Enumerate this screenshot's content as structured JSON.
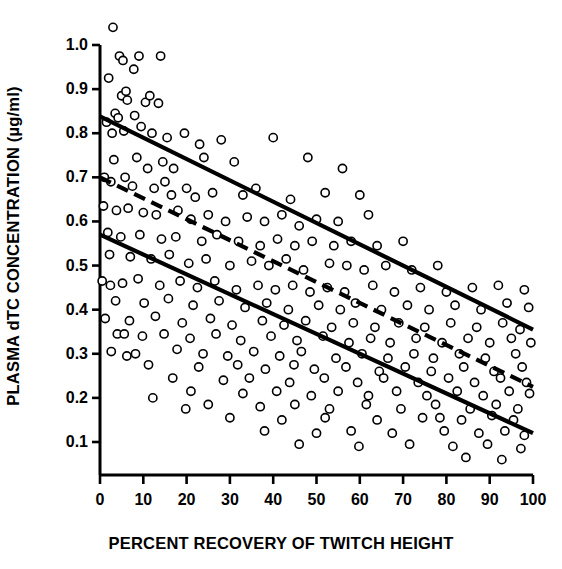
{
  "chart_data": {
    "type": "scatter",
    "title": "",
    "xlabel": "PERCENT RECOVERY OF TWITCH HEIGHT",
    "ylabel": "PLASMA dTC CONCENTRATION (µg/ml)",
    "xlim": [
      0,
      100
    ],
    "ylim": [
      0,
      1.06
    ],
    "grid": false,
    "legend": "none",
    "xticks": [
      0,
      10,
      20,
      30,
      40,
      50,
      60,
      70,
      80,
      90,
      100
    ],
    "xtick_labels": [
      "0",
      "10",
      "20",
      "30",
      "40",
      "50",
      "60",
      "70",
      "80",
      "90",
      "100"
    ],
    "yticks": [
      0.1,
      0.2,
      0.3,
      0.4,
      0.5,
      0.6,
      0.7,
      0.8,
      0.9,
      1.0
    ],
    "ytick_labels": [
      "0.1",
      "0.2",
      "0.3",
      "0.4",
      "0.5",
      "0.6",
      "0.7",
      "0.8",
      "0.9",
      "1.0"
    ],
    "marker": {
      "shape": "open-circle",
      "fill": "#ffffff",
      "stroke": "#000000",
      "radius_px": 4.1,
      "stroke_width_px": 1.6
    },
    "lines": [
      {
        "name": "upper-confidence-line",
        "style": "solid",
        "color": "#000000",
        "width_px": 4.2,
        "x": [
          0,
          100
        ],
        "y": [
          0.838,
          0.355
        ]
      },
      {
        "name": "regression-line",
        "style": "dashed",
        "color": "#000000",
        "width_px": 4.2,
        "dash_px": [
          12,
          7
        ],
        "x": [
          0,
          100
        ],
        "y": [
          0.7,
          0.225
        ]
      },
      {
        "name": "lower-confidence-line",
        "style": "solid",
        "color": "#000000",
        "width_px": 4.2,
        "x": [
          0,
          100
        ],
        "y": [
          0.57,
          0.12
        ]
      }
    ],
    "points": [
      [
        3.0,
        1.04
      ],
      [
        4.5,
        0.975
      ],
      [
        5.3,
        0.965
      ],
      [
        9.0,
        0.975
      ],
      [
        14.0,
        0.975
      ],
      [
        7.8,
        0.945
      ],
      [
        2.0,
        0.925
      ],
      [
        5.0,
        0.885
      ],
      [
        6.0,
        0.895
      ],
      [
        6.3,
        0.875
      ],
      [
        10.5,
        0.87
      ],
      [
        11.5,
        0.885
      ],
      [
        13.5,
        0.868
      ],
      [
        3.5,
        0.845
      ],
      [
        4.2,
        0.835
      ],
      [
        8.0,
        0.84
      ],
      [
        1.5,
        0.825
      ],
      [
        9.5,
        0.815
      ],
      [
        2.8,
        0.8
      ],
      [
        5.5,
        0.805
      ],
      [
        12.0,
        0.8
      ],
      [
        15.5,
        0.79
      ],
      [
        19.5,
        0.8
      ],
      [
        23.0,
        0.775
      ],
      [
        28.0,
        0.785
      ],
      [
        40.0,
        0.79
      ],
      [
        3.2,
        0.74
      ],
      [
        8.5,
        0.745
      ],
      [
        11.0,
        0.72
      ],
      [
        14.5,
        0.735
      ],
      [
        17.0,
        0.72
      ],
      [
        24.0,
        0.745
      ],
      [
        31.0,
        0.735
      ],
      [
        48.0,
        0.745
      ],
      [
        56.0,
        0.72
      ],
      [
        1.0,
        0.7
      ],
      [
        2.5,
        0.69
      ],
      [
        5.8,
        0.7
      ],
      [
        7.5,
        0.68
      ],
      [
        12.5,
        0.675
      ],
      [
        15.0,
        0.69
      ],
      [
        16.5,
        0.66
      ],
      [
        20.0,
        0.675
      ],
      [
        22.0,
        0.655
      ],
      [
        26.0,
        0.665
      ],
      [
        33.0,
        0.66
      ],
      [
        36.0,
        0.675
      ],
      [
        44.0,
        0.65
      ],
      [
        52.0,
        0.665
      ],
      [
        60.0,
        0.66
      ],
      [
        0.8,
        0.635
      ],
      [
        3.8,
        0.625
      ],
      [
        6.5,
        0.63
      ],
      [
        10.0,
        0.62
      ],
      [
        13.0,
        0.615
      ],
      [
        18.0,
        0.625
      ],
      [
        21.0,
        0.605
      ],
      [
        25.0,
        0.615
      ],
      [
        29.0,
        0.6
      ],
      [
        34.0,
        0.61
      ],
      [
        38.0,
        0.6
      ],
      [
        42.0,
        0.615
      ],
      [
        46.0,
        0.59
      ],
      [
        50.0,
        0.605
      ],
      [
        55.0,
        0.6
      ],
      [
        62.0,
        0.615
      ],
      [
        1.8,
        0.575
      ],
      [
        4.8,
        0.565
      ],
      [
        9.2,
        0.57
      ],
      [
        14.2,
        0.56
      ],
      [
        17.5,
        0.565
      ],
      [
        23.5,
        0.555
      ],
      [
        27.0,
        0.57
      ],
      [
        32.0,
        0.555
      ],
      [
        37.0,
        0.545
      ],
      [
        41.0,
        0.56
      ],
      [
        45.0,
        0.545
      ],
      [
        49.0,
        0.555
      ],
      [
        54.0,
        0.545
      ],
      [
        58.0,
        0.555
      ],
      [
        64.0,
        0.545
      ],
      [
        70.0,
        0.555
      ],
      [
        2.2,
        0.525
      ],
      [
        7.0,
        0.52
      ],
      [
        11.8,
        0.515
      ],
      [
        16.0,
        0.525
      ],
      [
        20.5,
        0.505
      ],
      [
        24.5,
        0.515
      ],
      [
        30.0,
        0.5
      ],
      [
        35.0,
        0.51
      ],
      [
        39.0,
        0.5
      ],
      [
        43.0,
        0.515
      ],
      [
        47.0,
        0.49
      ],
      [
        53.0,
        0.505
      ],
      [
        57.0,
        0.5
      ],
      [
        61.0,
        0.49
      ],
      [
        66.0,
        0.5
      ],
      [
        72.0,
        0.49
      ],
      [
        78.0,
        0.5
      ],
      [
        0.5,
        0.465
      ],
      [
        5.2,
        0.46
      ],
      [
        8.8,
        0.47
      ],
      [
        13.8,
        0.455
      ],
      [
        18.5,
        0.465
      ],
      [
        22.5,
        0.45
      ],
      [
        26.5,
        0.465
      ],
      [
        31.5,
        0.445
      ],
      [
        36.5,
        0.455
      ],
      [
        40.5,
        0.445
      ],
      [
        44.5,
        0.455
      ],
      [
        48.5,
        0.44
      ],
      [
        52.5,
        0.45
      ],
      [
        56.5,
        0.44
      ],
      [
        63.0,
        0.455
      ],
      [
        68.0,
        0.44
      ],
      [
        74.0,
        0.45
      ],
      [
        80.0,
        0.44
      ],
      [
        86.0,
        0.45
      ],
      [
        92.0,
        0.455
      ],
      [
        98.0,
        0.445
      ],
      [
        3.6,
        0.42
      ],
      [
        10.2,
        0.415
      ],
      [
        15.8,
        0.425
      ],
      [
        21.5,
        0.41
      ],
      [
        27.5,
        0.42
      ],
      [
        33.5,
        0.405
      ],
      [
        38.5,
        0.415
      ],
      [
        43.5,
        0.4
      ],
      [
        50.5,
        0.41
      ],
      [
        55.5,
        0.4
      ],
      [
        59.0,
        0.415
      ],
      [
        65.0,
        0.4
      ],
      [
        71.0,
        0.41
      ],
      [
        76.0,
        0.4
      ],
      [
        82.0,
        0.41
      ],
      [
        88.0,
        0.4
      ],
      [
        94.0,
        0.415
      ],
      [
        99.0,
        0.405
      ],
      [
        1.2,
        0.38
      ],
      [
        6.8,
        0.375
      ],
      [
        12.8,
        0.385
      ],
      [
        19.0,
        0.37
      ],
      [
        25.5,
        0.38
      ],
      [
        30.5,
        0.365
      ],
      [
        37.5,
        0.375
      ],
      [
        42.5,
        0.365
      ],
      [
        47.5,
        0.375
      ],
      [
        53.5,
        0.36
      ],
      [
        58.5,
        0.37
      ],
      [
        63.5,
        0.36
      ],
      [
        69.0,
        0.37
      ],
      [
        75.0,
        0.36
      ],
      [
        81.0,
        0.37
      ],
      [
        87.0,
        0.36
      ],
      [
        93.0,
        0.37
      ],
      [
        97.0,
        0.355
      ],
      [
        4.0,
        0.345
      ],
      [
        9.8,
        0.34
      ],
      [
        14.8,
        0.345
      ],
      [
        20.8,
        0.335
      ],
      [
        26.8,
        0.345
      ],
      [
        32.5,
        0.33
      ],
      [
        39.5,
        0.34
      ],
      [
        45.5,
        0.33
      ],
      [
        51.5,
        0.34
      ],
      [
        57.5,
        0.325
      ],
      [
        62.5,
        0.335
      ],
      [
        67.0,
        0.325
      ],
      [
        73.0,
        0.335
      ],
      [
        79.0,
        0.325
      ],
      [
        85.0,
        0.335
      ],
      [
        90.0,
        0.325
      ],
      [
        95.0,
        0.335
      ],
      [
        99.5,
        0.325
      ],
      [
        2.6,
        0.305
      ],
      [
        8.2,
        0.3
      ],
      [
        17.8,
        0.31
      ],
      [
        23.8,
        0.3
      ],
      [
        29.5,
        0.295
      ],
      [
        35.5,
        0.305
      ],
      [
        41.5,
        0.295
      ],
      [
        46.5,
        0.305
      ],
      [
        54.5,
        0.29
      ],
      [
        60.5,
        0.3
      ],
      [
        66.5,
        0.29
      ],
      [
        72.5,
        0.3
      ],
      [
        77.0,
        0.29
      ],
      [
        83.0,
        0.3
      ],
      [
        89.0,
        0.29
      ],
      [
        96.0,
        0.3
      ],
      [
        11.2,
        0.275
      ],
      [
        22.8,
        0.27
      ],
      [
        31.8,
        0.275
      ],
      [
        38.2,
        0.265
      ],
      [
        44.8,
        0.275
      ],
      [
        49.5,
        0.265
      ],
      [
        56.8,
        0.27
      ],
      [
        64.5,
        0.26
      ],
      [
        70.5,
        0.27
      ],
      [
        76.5,
        0.26
      ],
      [
        84.0,
        0.27
      ],
      [
        91.0,
        0.26
      ],
      [
        97.5,
        0.27
      ],
      [
        16.8,
        0.245
      ],
      [
        28.5,
        0.24
      ],
      [
        34.5,
        0.245
      ],
      [
        43.8,
        0.235
      ],
      [
        51.8,
        0.245
      ],
      [
        59.5,
        0.235
      ],
      [
        65.5,
        0.245
      ],
      [
        73.5,
        0.235
      ],
      [
        80.5,
        0.245
      ],
      [
        86.5,
        0.235
      ],
      [
        92.5,
        0.245
      ],
      [
        98.5,
        0.235
      ],
      [
        21.0,
        0.215
      ],
      [
        33.0,
        0.21
      ],
      [
        40.8,
        0.215
      ],
      [
        48.8,
        0.205
      ],
      [
        55.0,
        0.215
      ],
      [
        62.0,
        0.205
      ],
      [
        68.5,
        0.215
      ],
      [
        75.5,
        0.205
      ],
      [
        82.5,
        0.215
      ],
      [
        88.5,
        0.205
      ],
      [
        94.5,
        0.215
      ],
      [
        99.2,
        0.21
      ],
      [
        25.0,
        0.185
      ],
      [
        37.0,
        0.18
      ],
      [
        45.0,
        0.185
      ],
      [
        53.0,
        0.175
      ],
      [
        61.5,
        0.185
      ],
      [
        69.5,
        0.175
      ],
      [
        77.5,
        0.185
      ],
      [
        85.5,
        0.175
      ],
      [
        91.5,
        0.185
      ],
      [
        96.5,
        0.175
      ],
      [
        30.0,
        0.155
      ],
      [
        42.0,
        0.15
      ],
      [
        52.0,
        0.155
      ],
      [
        64.0,
        0.15
      ],
      [
        74.5,
        0.155
      ],
      [
        83.5,
        0.15
      ],
      [
        90.5,
        0.16
      ],
      [
        95.5,
        0.15
      ],
      [
        38.0,
        0.125
      ],
      [
        50.0,
        0.12
      ],
      [
        58.0,
        0.125
      ],
      [
        67.5,
        0.12
      ],
      [
        79.5,
        0.125
      ],
      [
        87.5,
        0.12
      ],
      [
        93.5,
        0.125
      ],
      [
        98.0,
        0.115
      ],
      [
        46.0,
        0.095
      ],
      [
        59.8,
        0.09
      ],
      [
        71.5,
        0.095
      ],
      [
        81.5,
        0.09
      ],
      [
        89.5,
        0.095
      ],
      [
        97.2,
        0.085
      ],
      [
        84.5,
        0.065
      ],
      [
        92.8,
        0.06
      ],
      [
        78.5,
        0.155
      ],
      [
        12.2,
        0.2
      ],
      [
        19.8,
        0.175
      ],
      [
        5.6,
        0.345
      ],
      [
        6.2,
        0.295
      ],
      [
        2.4,
        0.455
      ]
    ]
  },
  "axes": {
    "y_axis_name": "y-axis",
    "x_axis_name": "x-axis"
  }
}
